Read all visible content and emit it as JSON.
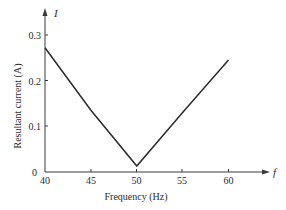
{
  "chart_data": {
    "type": "line",
    "title": "",
    "xlabel": "Frequency (Hz)",
    "ylabel": "Resultant current (A)",
    "x_axis_symbol": "f",
    "y_axis_symbol": "I",
    "xlim": [
      40,
      60
    ],
    "ylim": [
      0,
      0.3
    ],
    "x_ticks": [
      40,
      45,
      50,
      55,
      60
    ],
    "y_ticks": [
      0,
      0.1,
      0.2,
      0.3
    ],
    "x_tick_labels": [
      "40",
      "45",
      "50",
      "55",
      "60"
    ],
    "y_tick_labels": [
      "0",
      "0.1",
      "0.2",
      "0.3"
    ],
    "grid": false,
    "legend": null,
    "series": [
      {
        "name": "Resultant current",
        "x": [
          40,
          45,
          50,
          55,
          60
        ],
        "values": [
          0.272,
          0.135,
          0.013,
          0.13,
          0.245
        ]
      }
    ],
    "annotations": [
      "Minimum current at resonance frequency 50 Hz"
    ]
  },
  "colors": {
    "line": "#2b2b2b",
    "axis": "#3a3a3a",
    "background": "#ffffff"
  }
}
